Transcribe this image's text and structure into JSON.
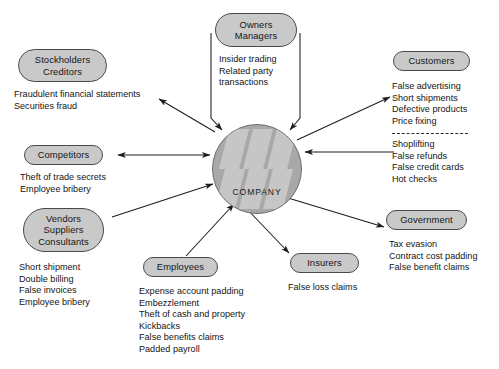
{
  "diagram": {
    "center": {
      "label": "COMPANY",
      "fill_color": "#a8a8a8",
      "pattern_color": "#c4c4c4"
    },
    "node_fill_color": "#c9c9c9",
    "node_border_color": "#4a4a4a",
    "nodes": [
      {
        "id": "stockholders",
        "lines": [
          "Stockholders",
          "Creditors"
        ],
        "items": [
          "Fraudulent financial statements",
          "Securities fraud"
        ],
        "arrow": "from-company"
      },
      {
        "id": "owners",
        "lines": [
          "Owners",
          "Managers"
        ],
        "items": [
          "Insider trading",
          "Related party",
          "transactions"
        ],
        "arrow": "to-company"
      },
      {
        "id": "customers",
        "lines": [
          "Customers"
        ],
        "items": [
          "False advertising",
          "Short shipments",
          "Defective products",
          "Price fixing"
        ],
        "items2": [
          "Shoplifting",
          "False refunds",
          "False credit cards",
          "Hot checks"
        ],
        "arrow": "from-company",
        "arrow2": "to-company"
      },
      {
        "id": "competitors",
        "lines": [
          "Competitors"
        ],
        "items": [
          "Theft of trade secrets",
          "Employee bribery"
        ],
        "arrow": "bidirectional"
      },
      {
        "id": "vendors",
        "lines": [
          "Vendors",
          "Suppliers",
          "Consultants"
        ],
        "items": [
          "Short shipment",
          "Double billing",
          "False invoices",
          "Employee bribery"
        ],
        "arrow": "to-company"
      },
      {
        "id": "employees",
        "lines": [
          "Employees"
        ],
        "items": [
          "Expense account padding",
          "Embezzlement",
          "Theft of cash and property",
          "Kickbacks",
          "False benefits claims",
          "Padded payroll"
        ],
        "arrow": "to-company"
      },
      {
        "id": "insurers",
        "lines": [
          "Insurers"
        ],
        "items": [
          "False loss claims"
        ],
        "arrow": "from-company"
      },
      {
        "id": "government",
        "lines": [
          "Government"
        ],
        "items": [
          "Tax evasion",
          "Contract cost padding",
          "False benefit claims"
        ],
        "arrow": "from-company"
      }
    ]
  }
}
